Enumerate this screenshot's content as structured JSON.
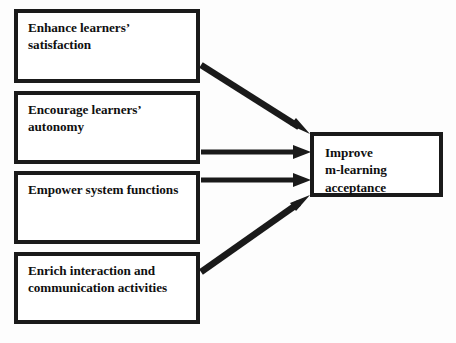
{
  "diagram": {
    "background_color": "#fdfdfd",
    "line_color": "#1a1a1a",
    "sources": [
      {
        "id": "enhance-learners-satisfaction",
        "label": "Enhance learners’\nsatisfaction"
      },
      {
        "id": "encourage-learners-autonomy",
        "label": "Encourage learners’\nautonomy"
      },
      {
        "id": "empower-system-functions",
        "label": "Empower system functions"
      },
      {
        "id": "enrich-interaction-and-communication-activities",
        "label": "Enrich interaction and\ncommunication activities"
      }
    ],
    "target": {
      "id": "improve-m-learning-acceptance",
      "label": "Improve\nm-learning\nacceptance"
    },
    "connectors": [
      {
        "from": "enhance-learners-satisfaction",
        "to": "improve-m-learning-acceptance",
        "style": "diagonal-down"
      },
      {
        "from": "encourage-learners-autonomy",
        "to": "improve-m-learning-acceptance",
        "style": "horizontal"
      },
      {
        "from": "empower-system-functions",
        "to": "improve-m-learning-acceptance",
        "style": "horizontal"
      },
      {
        "from": "enrich-interaction-and-communication-activities",
        "to": "improve-m-learning-acceptance",
        "style": "diagonal-up"
      }
    ]
  }
}
